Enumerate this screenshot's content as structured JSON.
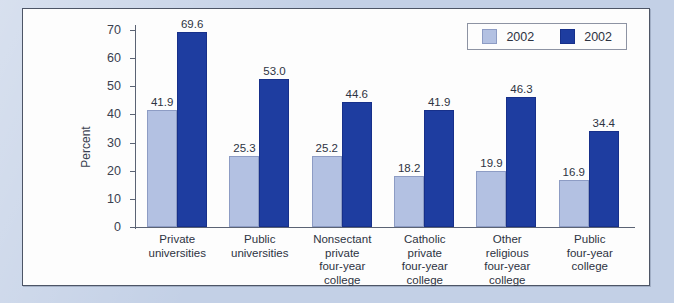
{
  "chart_data": {
    "type": "bar",
    "title": "",
    "xlabel": "",
    "ylabel": "Percent",
    "ylim": [
      0,
      70
    ],
    "yticks": [
      0,
      10,
      20,
      30,
      40,
      50,
      60,
      70
    ],
    "grid": false,
    "legend_position": "top-right",
    "categories": [
      "Private universities",
      "Public universities",
      "Nonsectant private four-year college",
      "Catholic private four-year college",
      "Other religious four-year college",
      "Public four-year college"
    ],
    "category_lines": [
      [
        "Private",
        "universities"
      ],
      [
        "Public",
        "universities"
      ],
      [
        "Nonsectant",
        "private",
        "four-year",
        "college"
      ],
      [
        "Catholic",
        "private",
        "four-year",
        "college"
      ],
      [
        "Other",
        "religious",
        "four-year",
        "college"
      ],
      [
        "Public",
        "four-year",
        "college"
      ]
    ],
    "series": [
      {
        "name": "2002",
        "color": "#b3c1e2",
        "values": [
          41.9,
          25.3,
          25.2,
          18.2,
          19.9,
          16.9
        ],
        "labels": [
          "41.9",
          "25.3",
          "25.2",
          "18.2",
          "19.9",
          "16.9"
        ]
      },
      {
        "name": "2002",
        "color": "#1e3da0",
        "values": [
          69.6,
          53.0,
          44.6,
          41.9,
          46.3,
          34.4
        ],
        "labels": [
          "69.6",
          "53.0",
          "44.6",
          "41.9",
          "46.3",
          "34.4"
        ]
      }
    ]
  },
  "legend": {
    "entries": [
      {
        "label": "2002",
        "color": "#b3c1e2"
      },
      {
        "label": "2002",
        "color": "#1e3da0"
      }
    ]
  },
  "axis": {
    "y_tick_labels": [
      "70",
      "60",
      "50",
      "40",
      "30",
      "20",
      "10",
      "0"
    ],
    "y_title": "Percent"
  },
  "colors": {
    "series_light": "#b3c1e2",
    "series_dark": "#1e3da0",
    "page_background": "#c3d0e6",
    "panel_background": "#fdfdfd",
    "panel_border": "#4d5566",
    "text": "#2d3342"
  }
}
